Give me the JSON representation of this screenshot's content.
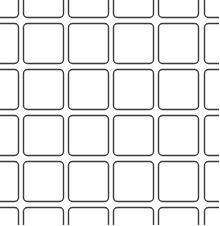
{
  "graphic": {
    "kind": "rounded-square-lattice",
    "stroke_color": "#3a3a3a",
    "background": "#ffffff",
    "corner_radius": 4,
    "cell_size": 41,
    "gutter": 5,
    "column_left_edges": [
      -22,
      23,
      68,
      113,
      158,
      204
    ],
    "row_top_edges": [
      -23,
      23,
      69,
      115,
      161,
      207
    ],
    "visible_full_columns": 4,
    "visible_full_rows": 4
  }
}
